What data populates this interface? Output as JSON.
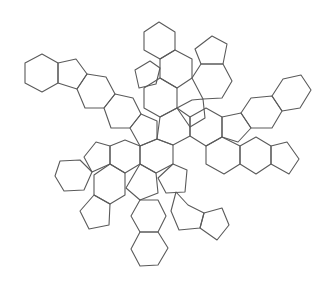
{
  "figure": {
    "stroke_color": "#5a5a5a",
    "background": "#ffffff"
  },
  "rings": [
    {
      "type": "hexagon",
      "points": "42,54 58,63 58,83 42,92 25,83 25,63"
    },
    {
      "type": "pentagon",
      "points": "58,63 76,59 87,74 77,89 58,83"
    },
    {
      "type": "hexagon",
      "points": "87,74 106,77 115,94 104,108 85,108 77,89"
    },
    {
      "type": "hexagon",
      "points": "115,94 133,98 141,114 130,128 111,128 104,108"
    },
    {
      "type": "pentagon",
      "points": "141,114 157,121 157,139 140,146 130,128"
    },
    {
      "type": "hexagon",
      "points": "159,22 175,32 175,50 160,59 144,50 144,32"
    },
    {
      "type": "hexagon",
      "points": "160,59 175,50 192,59 192,78 177,88 160,78"
    },
    {
      "type": "pentagon",
      "points": "135,70 150,61 160,68 156,84 139,88"
    },
    {
      "type": "hexagon",
      "points": "160,78 177,88 177,108 160,117 144,108 144,88"
    },
    {
      "type": "pentagon",
      "points": "212,36 227,44 223,64 201,64 195,49"
    },
    {
      "type": "hexagon",
      "points": "201,64 223,64 232,81 222,98 203,99 192,78"
    },
    {
      "type": "pentagon",
      "points": "177,108 192,100 203,99 205,118 190,127"
    },
    {
      "type": "hexagon",
      "points": "160,117 177,108 190,117 190,136 173,145 157,139"
    },
    {
      "type": "hexagon",
      "points": "190,117 206,108 222,117 222,137 206,146 190,136"
    },
    {
      "type": "pentagon",
      "points": "222,117 241,113 251,128 238,142 222,137"
    },
    {
      "type": "hexagon",
      "points": "241,113 251,98 272,96 282,111 272,128 251,128"
    },
    {
      "type": "hexagon",
      "points": "272,96 283,79 301,75 311,90 300,108 282,111"
    },
    {
      "type": "hexagon",
      "points": "206,146 222,137 240,146 240,164 224,174 206,164"
    },
    {
      "type": "hexagon",
      "points": "240,146 256,137 271,146 271,164 256,174 240,164"
    },
    {
      "type": "pentagon",
      "points": "271,146 287,142 299,159 289,174 271,164"
    },
    {
      "type": "hexagon",
      "points": "140,146 157,139 173,145 173,164 156,173 140,164"
    },
    {
      "type": "hexagon",
      "points": "110,146 125,140 140,146 140,164 125,173 110,164"
    },
    {
      "type": "pentagon",
      "points": "96,142 110,146 110,164 92,172 84,157"
    },
    {
      "type": "hexagon",
      "points": "60,161 80,160 92,172 84,190 64,191 55,176"
    },
    {
      "type": "hexagon",
      "points": "94,175 110,164 125,173 125,195 110,204 94,195"
    },
    {
      "type": "pentagon",
      "points": "94,195 110,204 109,225 89,229 80,211"
    },
    {
      "type": "pentagon",
      "points": "173,164 187,170 185,192 166,193 158,178"
    },
    {
      "type": "hexagon",
      "points": "176,192 188,205 204,213 200,228 179,230 171,211"
    },
    {
      "type": "pentagon",
      "points": "204,213 222,208 229,225 217,240 200,228"
    },
    {
      "type": "pentagon",
      "points": "140,164 156,173 158,193 140,200 126,188"
    },
    {
      "type": "hexagon",
      "points": "140,200 158,200 166,216 158,232 140,232 131,216"
    },
    {
      "type": "hexagon",
      "points": "140,232 158,232 168,248 158,265 140,266 131,249"
    }
  ]
}
